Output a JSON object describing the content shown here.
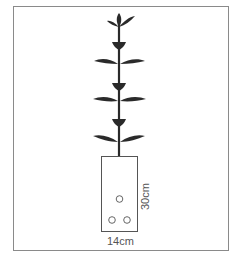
{
  "figure": {
    "pot": {
      "width_label": "14cm",
      "height_label": "30cm",
      "holes": 3
    },
    "plant": {
      "leaf_pairs": 2,
      "buds": 3,
      "top_sprout": true
    },
    "colors": {
      "plant": "#2a2a2a",
      "pot_outline": "#555555",
      "frame": "#8a8a8a",
      "text": "#555555"
    }
  }
}
